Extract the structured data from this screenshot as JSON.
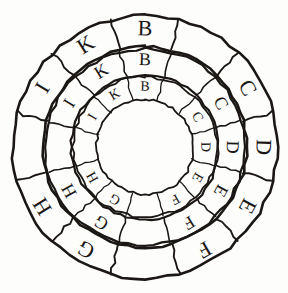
{
  "figure": {
    "type": "volvelle-diagram",
    "background_color": "#fdfdfc",
    "ink_color": "#1a1715"
  },
  "geometry": {
    "center_x": 145,
    "center_y": 147,
    "radii": {
      "outer_outer": 132,
      "outer_inner": 101,
      "middle_outer": 99,
      "middle_inner": 73,
      "inner_outer": 71,
      "inner_inner": 48
    },
    "cells_per_ring": 12,
    "start_angle_deg": -105,
    "cell_span_deg": 30
  },
  "rings": [
    {
      "name": "outer-ring",
      "label": "Outer ring",
      "letter_size": 22,
      "stroke_width": 2.6,
      "cells": [
        {
          "index": 0,
          "label": "B",
          "blank": false
        },
        {
          "index": 1,
          "label": "",
          "blank": true
        },
        {
          "index": 2,
          "label": "C",
          "blank": false
        },
        {
          "index": 3,
          "label": "D",
          "blank": false
        },
        {
          "index": 4,
          "label": "E",
          "blank": false
        },
        {
          "index": 5,
          "label": "F",
          "blank": false
        },
        {
          "index": 6,
          "label": "",
          "blank": true
        },
        {
          "index": 7,
          "label": "G",
          "blank": false
        },
        {
          "index": 8,
          "label": "H",
          "blank": false
        },
        {
          "index": 9,
          "label": "",
          "blank": true
        },
        {
          "index": 10,
          "label": "I",
          "blank": false
        },
        {
          "index": 11,
          "label": "K",
          "blank": false
        }
      ]
    },
    {
      "name": "middle-ring",
      "label": "Middle ring",
      "letter_size": 18,
      "stroke_width": 2.2,
      "cells": [
        {
          "index": 0,
          "label": "B",
          "blank": false
        },
        {
          "index": 1,
          "label": "",
          "blank": true
        },
        {
          "index": 2,
          "label": "C",
          "blank": false
        },
        {
          "index": 3,
          "label": "D",
          "blank": false
        },
        {
          "index": 4,
          "label": "E",
          "blank": false
        },
        {
          "index": 5,
          "label": "F",
          "blank": false
        },
        {
          "index": 6,
          "label": "",
          "blank": true
        },
        {
          "index": 7,
          "label": "G",
          "blank": false
        },
        {
          "index": 8,
          "label": "H",
          "blank": false
        },
        {
          "index": 9,
          "label": "",
          "blank": true
        },
        {
          "index": 10,
          "label": "I",
          "blank": false
        },
        {
          "index": 11,
          "label": "K",
          "blank": false
        }
      ]
    },
    {
      "name": "inner-ring",
      "label": "Inner ring",
      "letter_size": 14,
      "stroke_width": 1.8,
      "cells": [
        {
          "index": 0,
          "label": "B",
          "blank": false
        },
        {
          "index": 1,
          "label": "",
          "blank": true
        },
        {
          "index": 2,
          "label": "C",
          "blank": false
        },
        {
          "index": 3,
          "label": "D",
          "blank": false
        },
        {
          "index": 4,
          "label": "E",
          "blank": false
        },
        {
          "index": 5,
          "label": "F",
          "blank": false
        },
        {
          "index": 6,
          "label": "",
          "blank": true
        },
        {
          "index": 7,
          "label": "G",
          "blank": false
        },
        {
          "index": 8,
          "label": "H",
          "blank": false
        },
        {
          "index": 9,
          "label": "",
          "blank": true
        },
        {
          "index": 10,
          "label": "I",
          "blank": false
        },
        {
          "index": 11,
          "label": "K",
          "blank": false
        }
      ]
    }
  ],
  "hub": {
    "name": "center-disc",
    "label": "",
    "radius": 48
  }
}
